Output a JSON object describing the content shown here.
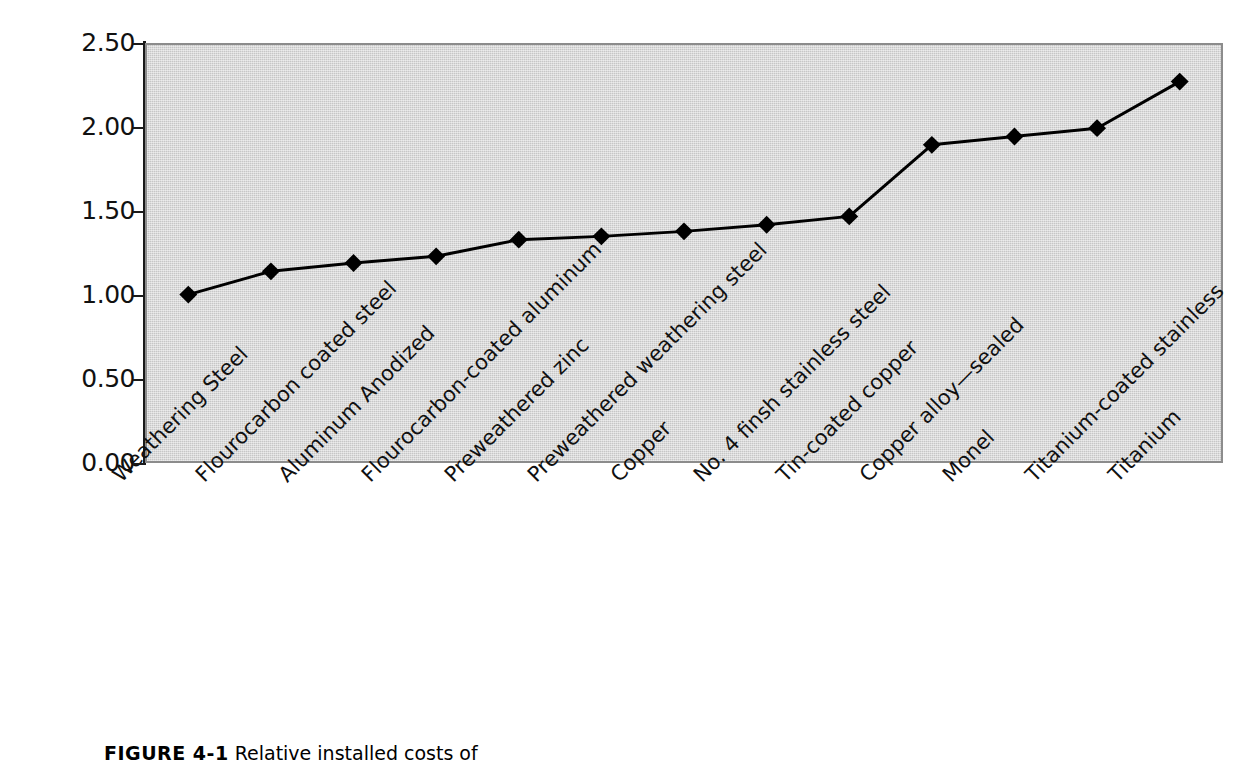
{
  "chart_data": {
    "type": "line",
    "title": "",
    "xlabel": "",
    "ylabel": "",
    "ylim": [
      0.0,
      2.5
    ],
    "ytick_labels": [
      "2.50",
      "2.00",
      "1.50",
      "1.00",
      "0.50",
      "0.00"
    ],
    "ytick_values": [
      2.5,
      2.0,
      1.5,
      1.0,
      0.5,
      0.0
    ],
    "grid": false,
    "legend": "none",
    "plot_background": "#c6c6c6",
    "line_color": "#000000",
    "marker": "diamond",
    "marker_color": "#000000",
    "categories": [
      "Weathering Steel",
      "Flourocarbon coated steel",
      "Aluminum Anodized",
      "Flourocarbon-coated aluminum",
      "Preweathered zinc",
      "Preweathered weathering steel",
      "Copper",
      "No. 4 finsh stainless steel",
      "Tin-coated copper",
      "Copper alloy—sealed",
      "Monel",
      "Titanium-coated stainless",
      "Titanium"
    ],
    "values": [
      1.0,
      1.14,
      1.19,
      1.23,
      1.33,
      1.35,
      1.38,
      1.42,
      1.47,
      1.9,
      1.95,
      2.0,
      2.28
    ]
  },
  "caption": {
    "label": "FIGURE 4-1",
    "text": "Relative installed costs of"
  }
}
